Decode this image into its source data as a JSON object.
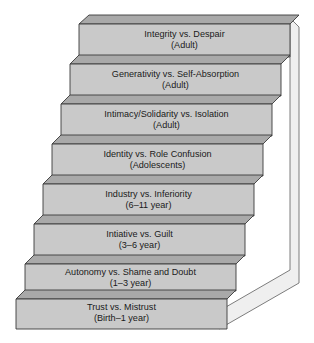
{
  "diagram": {
    "type": "staircase-diagram",
    "orientation": "ascending-left-to-right-bottom-to-top",
    "colors": {
      "step_face": "#c9c9c9",
      "step_top": "#a9a9a9",
      "side_wall": "#efefef",
      "outline": "#3a3a3a",
      "text": "#1a1a1a",
      "background": "#ffffff"
    },
    "steps": [
      {
        "index": 8,
        "position": "top",
        "stage": "Integrity vs. Despair",
        "age": "(Adult)"
      },
      {
        "index": 7,
        "position": "seventh",
        "stage": "Generativity vs. Self-Absorption",
        "age": "(Adult)"
      },
      {
        "index": 6,
        "position": "sixth",
        "stage": "Intimacy/Solidarity vs. Isolation",
        "age": "(Adult)"
      },
      {
        "index": 5,
        "position": "fifth",
        "stage": "Identity vs. Role Confusion",
        "age": "(Adolescents)"
      },
      {
        "index": 4,
        "position": "fourth",
        "stage": "Industry vs. Inferiority",
        "age": "(6–11 year)"
      },
      {
        "index": 3,
        "position": "third",
        "stage": "Intiative vs. Guilt",
        "age": "(3–6 year)"
      },
      {
        "index": 2,
        "position": "second",
        "stage": "Autonomy vs. Shame and Doubt",
        "age": "(1–3 year)"
      },
      {
        "index": 1,
        "position": "bottom",
        "stage": "Trust vs. Mistrust",
        "age": "(Birth–1 year)"
      }
    ]
  }
}
